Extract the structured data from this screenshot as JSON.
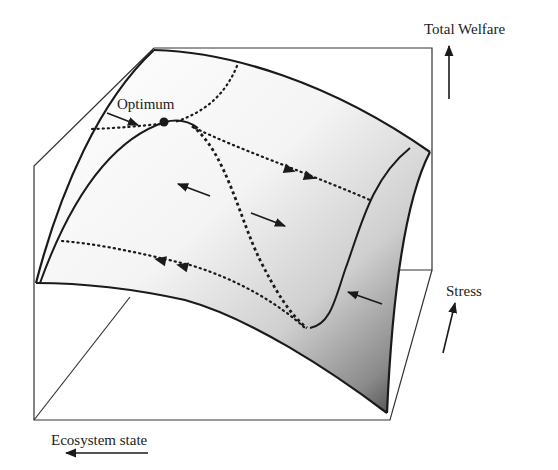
{
  "diagram": {
    "axes": {
      "z_label": "Total Welfare",
      "y_label": "Stress",
      "x_label": "Ecosystem state"
    },
    "annotations": {
      "optimum_label": "Optimum"
    },
    "colors": {
      "line": "#1a1a1a",
      "surface_light": "#ffffff",
      "surface_dark": "#3a3a3a",
      "box": "#333333"
    }
  }
}
